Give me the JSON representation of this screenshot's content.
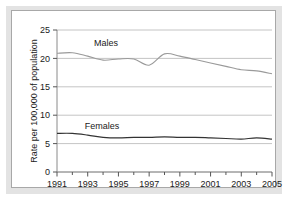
{
  "figure": {
    "background_color": "#e3e3e3",
    "panel_color": "#ffffff",
    "panel_border_color": "#a8a8a8"
  },
  "axis": {
    "y_title": "Rate per 100,000 of population",
    "y_ticks": [
      "0",
      "5",
      "10",
      "15",
      "20",
      "25"
    ],
    "x_ticks": [
      "1991",
      "1993",
      "1995",
      "1997",
      "1999",
      "2001",
      "2003",
      "2005"
    ]
  },
  "labels": {
    "males": "Males",
    "females": "Females"
  },
  "chart_data": {
    "type": "line",
    "title": "",
    "xlabel": "",
    "ylabel": "Rate per 100,000 of population",
    "xlim": [
      1991,
      2005
    ],
    "ylim": [
      0,
      25
    ],
    "grid": true,
    "legend": "inline-annotation",
    "x": [
      1991,
      1992,
      1993,
      1994,
      1995,
      1996,
      1997,
      1998,
      1999,
      2000,
      2001,
      2002,
      2003,
      2004,
      2005
    ],
    "series": [
      {
        "name": "Males",
        "color": "#9a9a9a",
        "values": [
          20.9,
          21.0,
          20.4,
          19.7,
          19.9,
          19.9,
          18.8,
          20.8,
          20.4,
          19.8,
          19.2,
          18.6,
          18.0,
          17.8,
          17.3
        ]
      },
      {
        "name": "Females",
        "color": "#333333",
        "values": [
          6.8,
          6.8,
          6.5,
          6.1,
          6.0,
          6.1,
          6.1,
          6.2,
          6.1,
          6.1,
          6.0,
          5.9,
          5.8,
          6.0,
          5.8
        ]
      }
    ],
    "y_ticks": [
      0,
      5,
      10,
      15,
      20,
      25
    ],
    "x_tick_labels": [
      1991,
      1993,
      1995,
      1997,
      1999,
      2001,
      2003,
      2005
    ],
    "annotations": [
      {
        "text": "Males",
        "x": 1994.0,
        "y": 22.9
      },
      {
        "text": "Females",
        "x": 1993.6,
        "y": 8.3
      }
    ]
  }
}
